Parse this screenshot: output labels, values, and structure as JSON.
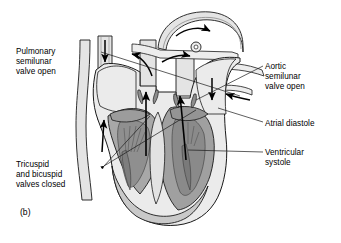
{
  "figure": {
    "caption": "(b)",
    "background_color": "#ffffff",
    "line_color": "#1a1a1a"
  },
  "palette": {
    "chamber_light": "#ebebeb",
    "vessel_fill": "#e4e4e4",
    "myocardium_mid": "#bdbdbd",
    "myocardium_dark": "#9a9a9a",
    "valve_tissue": "#8f8f8f",
    "outline": "#1a1a1a",
    "arrow": "#000000"
  },
  "labels": {
    "pulmonary_valve": "Pulmonary\nsemilunar\nvalve open",
    "tricuspid_bicuspid": "Tricuspid\nand bicuspid\nvalves closed",
    "aortic_valve": "Aortic\nsemilunar\nvalve open",
    "atrial_diastole": "Atrial diastole",
    "ventricular_systole": "Ventricular\nsystole"
  },
  "anatomy": {
    "structures": [
      "aortic arch",
      "superior vena cava",
      "inferior vena cava",
      "pulmonary trunk",
      "pulmonary veins",
      "right atrium",
      "left atrium",
      "right ventricle",
      "left ventricle",
      "interventricular septum",
      "papillary muscles",
      "chordae tendineae",
      "aortic semilunar valve",
      "pulmonary semilunar valve",
      "tricuspid valve",
      "bicuspid valve"
    ],
    "flow_arrows": [
      "aortic arch outflow, curving right over the arch",
      "superior vena cava inflow, downward",
      "inferior vena cava inflow, upward",
      "pulmonary trunk outflow, upward and curving left",
      "pulmonary vein inflow, downward on right",
      "pulmonary vein inflow, leftward into left atrium",
      "right ventricle ejection, long upward arrow through pulmonary valve",
      "left ventricle ejection, long upward arrow through aortic valve"
    ]
  }
}
